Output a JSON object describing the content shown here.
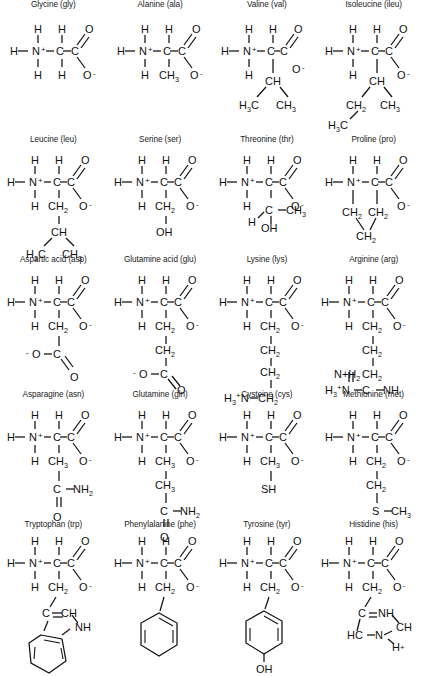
{
  "figure": {
    "kind": "amino-acid-structure-chart",
    "layout": {
      "columns": 4,
      "rows": 5,
      "total": 20
    },
    "background_color": "#ffffff",
    "ink_color": "#111111"
  },
  "atoms": {
    "H": "H",
    "C": "C",
    "N": "N",
    "O": "O",
    "S": "S",
    "plus": "+",
    "minus": "-",
    "two": "2",
    "three": "3",
    "CH": "CH",
    "CH2": "CH",
    "CH3": "CH",
    "NH": "NH",
    "NH2": "NH",
    "OH": "OH",
    "SH": "SH",
    "HC": "HC",
    "H3N": "H",
    "H3C": "H",
    "N_plus_H2": "N+H",
    "H_plus": "H+",
    "O_minus": "O",
    "minus_O": "-O"
  },
  "amino_acids": [
    {
      "id": "glycine",
      "name": "Glycine",
      "abbr": "gly",
      "title": "Glycine (gly)",
      "row": 1,
      "col": 1,
      "side_chain": [
        "H"
      ],
      "side_chain_text": "H"
    },
    {
      "id": "alanine",
      "name": "Alanine",
      "abbr": "ala",
      "title": "Alanine (ala)",
      "row": 1,
      "col": 2,
      "side_chain": [
        "CH3"
      ],
      "side_chain_text": "CH3"
    },
    {
      "id": "valine",
      "name": "Valine",
      "abbr": "val",
      "title": "Valine (val)",
      "row": 1,
      "col": 3,
      "side_chain": [
        "CH",
        "H3C",
        "CH3"
      ],
      "side_chain_text": "CH(CH3)CH3"
    },
    {
      "id": "isoleucine",
      "name": "Isoleucine",
      "abbr": "ileu",
      "title": "Isoleucine (ileu)",
      "row": 1,
      "col": 4,
      "side_chain": [
        "CH",
        "CH2",
        "CH3",
        "H3C"
      ],
      "side_chain_text": "CH(CH2CH3)CH3"
    },
    {
      "id": "leucine",
      "name": "Leucine",
      "abbr": "leu",
      "title": "Leucine (leu)",
      "row": 2,
      "col": 1,
      "side_chain": [
        "CH2",
        "CH",
        "H3C",
        "CH3"
      ],
      "side_chain_text": "CH2CH(CH3)CH3"
    },
    {
      "id": "serine",
      "name": "Serine",
      "abbr": "ser",
      "title": "Serine (ser)",
      "row": 2,
      "col": 2,
      "side_chain": [
        "CH2",
        "OH"
      ],
      "side_chain_text": "CH2OH"
    },
    {
      "id": "threonine",
      "name": "Threonine",
      "abbr": "thr",
      "title": "Threonine (thr)",
      "row": 2,
      "col": 3,
      "side_chain": [
        "C",
        "CH3",
        "H",
        "OH"
      ],
      "side_chain_text": "CH(OH)CH3"
    },
    {
      "id": "proline",
      "name": "Proline",
      "abbr": "pro",
      "title": "Proline (pro)",
      "row": 2,
      "col": 4,
      "side_chain": [
        "CH2",
        "CH2",
        "CH2"
      ],
      "side_chain_text": "ring CH2CH2CH2"
    },
    {
      "id": "aspartic-acid",
      "name": "Aspartic acid",
      "abbr": "asp",
      "title": "Aspartic acid (asp)",
      "row": 3,
      "col": 1,
      "side_chain": [
        "CH2",
        "C",
        "O",
        "O-"
      ],
      "side_chain_text": "CH2COO-"
    },
    {
      "id": "glutamine-acid",
      "name": "Glutamine acid",
      "abbr": "glu",
      "title": "Glutamine acid (glu)",
      "row": 3,
      "col": 2,
      "side_chain": [
        "CH2",
        "CH2",
        "C",
        "O",
        "O-"
      ],
      "side_chain_text": "CH2CH2COO-"
    },
    {
      "id": "lysine",
      "name": "Lysine",
      "abbr": "lys",
      "title": "Lysine (lys)",
      "row": 3,
      "col": 3,
      "side_chain": [
        "CH2",
        "CH2",
        "CH2",
        "CH2",
        "H3N+"
      ],
      "side_chain_text": "CH2CH2CH2CH2NH3+"
    },
    {
      "id": "arginine",
      "name": "Arginine",
      "abbr": "arg",
      "title": "Arginine (arg)",
      "row": 3,
      "col": 4,
      "side_chain": [
        "CH2",
        "CH2",
        "CH2",
        "NH",
        "C",
        "N+H2",
        "H3N+"
      ],
      "side_chain_text": "CH2CH2CH2NHC(N+H2)NH3+"
    },
    {
      "id": "asparagine",
      "name": "Asparagine",
      "abbr": "asn",
      "title": "Asparagine (asn)",
      "row": 4,
      "col": 1,
      "side_chain": [
        "CH3",
        "C",
        "NH2",
        "O"
      ],
      "side_chain_text": "CH2CONH2"
    },
    {
      "id": "glutamine",
      "name": "Glutamine",
      "abbr": "gln",
      "title": "Glutamine (gln)",
      "row": 4,
      "col": 2,
      "side_chain": [
        "CH3",
        "CH3",
        "C",
        "NH2",
        "O"
      ],
      "side_chain_text": "CH2CH2CONH2"
    },
    {
      "id": "cysteine",
      "name": "Cysteine",
      "abbr": "cys",
      "title": "Cysteine (cys)",
      "row": 4,
      "col": 3,
      "side_chain": [
        "CH3",
        "SH"
      ],
      "side_chain_text": "CH2SH"
    },
    {
      "id": "methionine",
      "name": "Methionine",
      "abbr": "met",
      "title": "Methionine (met)",
      "row": 4,
      "col": 4,
      "side_chain": [
        "CH2",
        "CH2",
        "S",
        "CH3"
      ],
      "side_chain_text": "CH2CH2SCH3"
    },
    {
      "id": "tryptophan",
      "name": "Tryptophan",
      "abbr": "trp",
      "title": "Tryptophan (trp)",
      "row": 5,
      "col": 1,
      "side_chain": [
        "CH2",
        "C",
        "CH",
        "NH",
        "benzene"
      ],
      "side_chain_text": "CH2-indole"
    },
    {
      "id": "phenylalanine",
      "name": "Phenylalanine",
      "abbr": "phe",
      "title": "Phenylalanine (phe)",
      "row": 5,
      "col": 2,
      "side_chain": [
        "CH2",
        "benzene"
      ],
      "side_chain_text": "CH2-phenyl"
    },
    {
      "id": "tyrosine",
      "name": "Tyrosine",
      "abbr": "tyr",
      "title": "Tyrosine (tyr)",
      "row": 5,
      "col": 3,
      "side_chain": [
        "CH2",
        "benzene",
        "OH"
      ],
      "side_chain_text": "CH2-phenol"
    },
    {
      "id": "histidine",
      "name": "Histidine",
      "abbr": "his",
      "title": "Histidine (his)",
      "row": 5,
      "col": 4,
      "side_chain": [
        "CH2",
        "C",
        "NH",
        "CH",
        "HC",
        "N",
        "H+"
      ],
      "side_chain_text": "CH2-imidazolium"
    }
  ],
  "backbone": {
    "amine_h_left": "H",
    "amine_n": "N",
    "amine_charge": "+",
    "amine_h_top": "H",
    "amine_h_bottom": "H",
    "alpha_c": "C",
    "alpha_h": "H",
    "carboxyl_c": "C",
    "carbonyl_o": "O",
    "carboxylate_o": "O",
    "carboxylate_charge": "-"
  }
}
